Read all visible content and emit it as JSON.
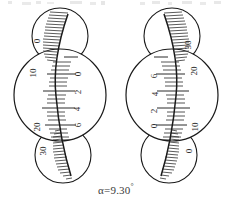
{
  "figure": {
    "kind": "optical-micrometer-scale-reading",
    "caption": "α=9.30",
    "caption_degree_symbol": "°",
    "stroke_color": "#1a1a1a",
    "hatch_color": "#4a4a4a",
    "background": "#ffffff",
    "instruments": [
      {
        "id": "left",
        "mirrored": false,
        "center_x": 60,
        "circles": [
          {
            "name": "upper-window",
            "cx": 60,
            "cy": 36,
            "r": 28,
            "labels": [
              {
                "text": "0",
                "x": 39,
                "y": 40
              }
            ]
          },
          {
            "name": "main-window",
            "cx": 60,
            "cy": 95,
            "r": 46,
            "labels": [
              {
                "text": "10",
                "x": 35,
                "y": 72
              },
              {
                "text": "20",
                "x": 39,
                "y": 126
              },
              {
                "text": "0",
                "x": 80,
                "y": 73
              },
              {
                "text": "2",
                "x": 80,
                "y": 91
              },
              {
                "text": "4",
                "x": 79,
                "y": 108
              },
              {
                "text": "6",
                "x": 80,
                "y": 124
              }
            ]
          },
          {
            "name": "lower-window",
            "cx": 63,
            "cy": 155,
            "r": 28,
            "labels": [
              {
                "text": "30",
                "x": 45,
                "y": 150
              }
            ]
          }
        ],
        "scale_line": {
          "top_x": 68,
          "top_y": 14,
          "mid_x": 56,
          "mid_y": 96,
          "bot_x": 71,
          "bot_y": 176
        },
        "hatch_side": "left"
      },
      {
        "id": "right",
        "mirrored": true,
        "center_x": 172,
        "circles": [
          {
            "name": "upper-window",
            "cx": 172,
            "cy": 36,
            "r": 28,
            "labels": [
              {
                "text": "30",
                "x": 190,
                "y": 44
              }
            ]
          },
          {
            "name": "main-window",
            "cx": 172,
            "cy": 95,
            "r": 46,
            "labels": [
              {
                "text": "20",
                "x": 196,
                "y": 70
              },
              {
                "text": "10",
                "x": 197,
                "y": 126
              },
              {
                "text": "6",
                "x": 156,
                "y": 75
              },
              {
                "text": "4",
                "x": 157,
                "y": 93
              },
              {
                "text": "2",
                "x": 156,
                "y": 110
              },
              {
                "text": "0",
                "x": 156,
                "y": 125
              }
            ]
          },
          {
            "name": "lower-window",
            "cx": 169,
            "cy": 155,
            "r": 28,
            "labels": [
              {
                "text": "0",
                "x": 191,
                "y": 150
              }
            ]
          }
        ],
        "scale_line": {
          "top_x": 164,
          "top_y": 14,
          "mid_x": 176,
          "mid_y": 96,
          "bot_x": 161,
          "bot_y": 176
        },
        "hatch_side": "right"
      }
    ],
    "tick_counts": {
      "main_major": 12,
      "main_minor": 24,
      "window_hatch": 26
    }
  }
}
